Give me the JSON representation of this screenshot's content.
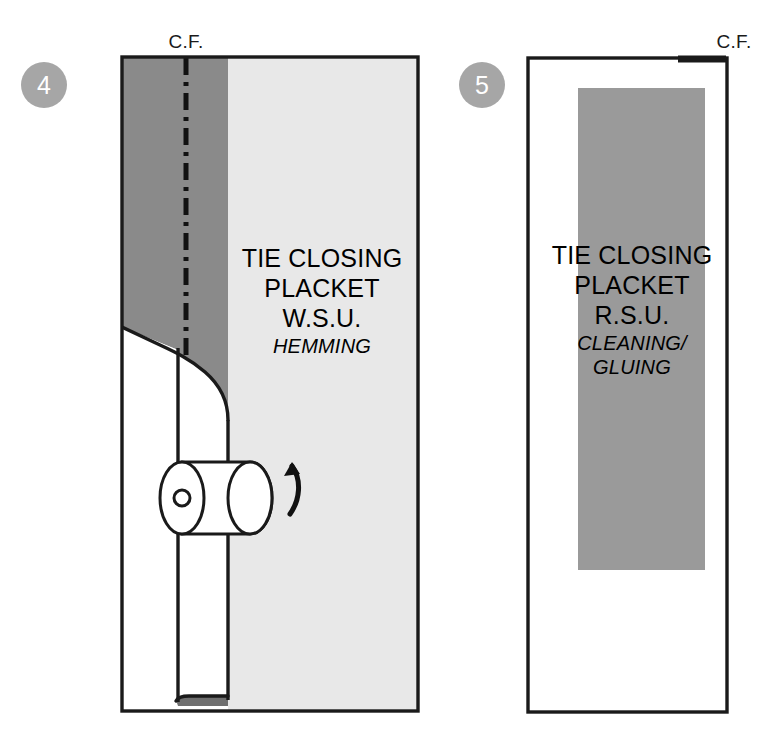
{
  "figure": {
    "colors": {
      "dark_gray_fabric": "#8a8a8a",
      "light_gray_fabric": "#e8e8e8",
      "medium_gray_fabric": "#9a9a9a",
      "badge_gray": "#a6a6a6",
      "outline": "#1a1a1a",
      "background": "#ffffff"
    }
  },
  "steps": [
    {
      "number": "4",
      "badge_name": "step-badge-4",
      "cf_label": "C.F.",
      "lines": [
        "TIE CLOSING",
        "PLACKET",
        "W.S.U."
      ],
      "operation": "HEMMING",
      "operation_style": "italic",
      "has_fold": true,
      "has_roller": true,
      "has_rotation_arrow": true,
      "has_center_front_line": true,
      "center_front_line_style": "dash-dot"
    },
    {
      "number": "5",
      "badge_name": "step-badge-5",
      "cf_label": "C.F.",
      "lines": [
        "TIE CLOSING",
        "PLACKET",
        "R.S.U."
      ],
      "operation": "CLEANING/",
      "operation_line2": "GLUING",
      "operation_style": "italic",
      "has_fold": false,
      "has_roller": false,
      "has_rotation_arrow": false,
      "has_center_front_line": false,
      "has_top_edge_bar": true
    }
  ]
}
